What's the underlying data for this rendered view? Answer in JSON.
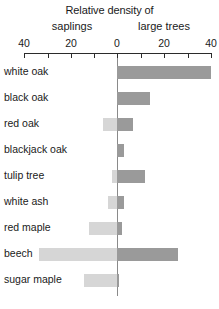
{
  "chart_data": {
    "type": "bar",
    "title": "Relative density of",
    "subtitle_left": "saplings",
    "subtitle_right": "large trees",
    "orientation": "horizontal-diverging",
    "xlabel": "",
    "ylabel": "",
    "grid": false,
    "legend_position": "none",
    "axis": {
      "ticks": [
        40,
        20,
        0,
        20,
        40
      ],
      "minor_ticks_per_interval": 1,
      "left_max": 40,
      "right_max": 40,
      "tick_positions_px": [
        24,
        71,
        117,
        164,
        211
      ]
    },
    "colors": {
      "saplings": "#d6d6d6",
      "large_trees": "#9a9a9a",
      "axis": "#2b2b2b",
      "zero_line": "#8a8a8a",
      "text": "#1a1a1a"
    },
    "categories": [
      "white oak",
      "black oak",
      "red oak",
      "blackjack oak",
      "tulip tree",
      "white ash",
      "red maple",
      "beech",
      "sugar maple"
    ],
    "series": [
      {
        "name": "saplings",
        "side": "left",
        "values": [
          0,
          0,
          6,
          0,
          2,
          4,
          12,
          33,
          14
        ]
      },
      {
        "name": "large trees",
        "side": "right",
        "values": [
          40,
          14,
          7,
          3,
          12,
          3,
          2,
          26,
          1
        ]
      }
    ]
  }
}
